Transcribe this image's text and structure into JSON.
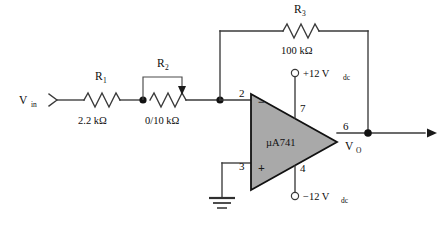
{
  "diagram": {
    "background_color": "#ffffff",
    "wire_color": "#3a3a3a",
    "opamp_fill_color": "#a9a9a9",
    "opamp_border_color": "#111111"
  },
  "input_port": {
    "label_main": "V",
    "label_sub": "in",
    "connector_icon": "input-arrow-marker"
  },
  "components": {
    "r1": {
      "reference_main": "R",
      "reference_sub": "1",
      "value": "2.2 kΩ",
      "type": "resistor"
    },
    "r2": {
      "reference_main": "R",
      "reference_sub": "2",
      "value": "0/10 kΩ",
      "type": "potentiometer"
    },
    "r3": {
      "reference_main": "R",
      "reference_sub": "3",
      "value": "100 kΩ",
      "type": "resistor"
    }
  },
  "opamp": {
    "part_number": "µA741",
    "inverting_input_sign": "−",
    "noninverting_input_sign": "+",
    "pins": {
      "inverting_input": "2",
      "noninverting_input": "3",
      "positive_supply": "7",
      "negative_supply": "4",
      "output": "6"
    }
  },
  "supplies": {
    "positive": {
      "label_main": "+12 V",
      "label_sub": "dc",
      "terminal_icon": "open-circle-terminal"
    },
    "negative": {
      "label_main": "−12 V",
      "label_sub": "dc",
      "terminal_icon": "open-circle-terminal"
    }
  },
  "output_port": {
    "label_main": "V",
    "label_sub": "O",
    "arrow_icon": "output-arrow-marker"
  },
  "ground": {
    "symbol_name": "earth-ground-symbol"
  }
}
